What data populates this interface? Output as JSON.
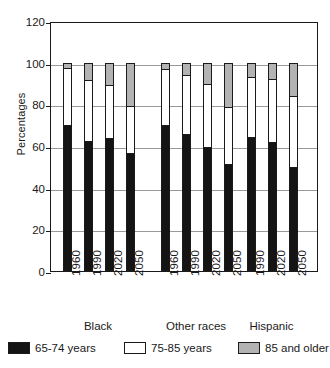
{
  "chart_data": {
    "type": "bar",
    "subtype": "stacked-bar-100",
    "title": "",
    "xlabel": "",
    "ylabel": "Percentages",
    "ylim": [
      0,
      120
    ],
    "yticks": [
      0,
      20,
      40,
      60,
      80,
      100,
      120
    ],
    "ytick_labels": [
      "0",
      "20",
      "40",
      "60",
      "80",
      "100",
      "120"
    ],
    "grid": true,
    "legend_position": "below",
    "legend": [
      "65-74 years",
      "75-85 years",
      "85 and older"
    ],
    "series": [
      {
        "name": "65-74 years",
        "color": "#141414",
        "values": [
          70,
          62,
          63.5,
          56,
          70,
          65.5,
          59,
          51,
          64,
          61.5,
          49.5
        ]
      },
      {
        "name": "75-85 years",
        "color": "#ffffff",
        "values": [
          27.5,
          29.5,
          25.5,
          23,
          27,
          28.5,
          30.5,
          27.5,
          29,
          30.5,
          34.5
        ]
      },
      {
        "name": "85 and older",
        "color": "#b3b3b3",
        "values": [
          2.5,
          8.5,
          11,
          21,
          3,
          6,
          10.5,
          21.5,
          7,
          8,
          16
        ]
      }
    ],
    "categories": [
      "1960",
      "1990",
      "2020",
      "2050",
      "1960",
      "1990",
      "2020",
      "2050",
      "1990",
      "2020",
      "2050"
    ],
    "groups": [
      {
        "label": "Black",
        "categories": [
          "1960",
          "1990",
          "2020",
          "2050"
        ]
      },
      {
        "label": "Other races",
        "categories": [
          "1960",
          "1990",
          "2020",
          "2050"
        ]
      },
      {
        "label": "Hispanic",
        "categories": [
          "1990",
          "2020",
          "2050"
        ]
      }
    ],
    "bars": [
      {
        "group": "Black",
        "year": "1960",
        "young": 70,
        "mid": 27.5,
        "old": 2.5
      },
      {
        "group": "Black",
        "year": "1990",
        "young": 62,
        "mid": 29.5,
        "old": 8.5
      },
      {
        "group": "Black",
        "year": "2020",
        "young": 63.5,
        "mid": 25.5,
        "old": 11
      },
      {
        "group": "Black",
        "year": "2050",
        "young": 56,
        "mid": 23,
        "old": 21
      },
      {
        "group": "Other races",
        "year": "1960",
        "young": 70,
        "mid": 27,
        "old": 3
      },
      {
        "group": "Other races",
        "year": "1990",
        "young": 65.5,
        "mid": 28.5,
        "old": 6
      },
      {
        "group": "Other races",
        "year": "2020",
        "young": 59,
        "mid": 30.5,
        "old": 10.5
      },
      {
        "group": "Other races",
        "year": "2050",
        "young": 51,
        "mid": 27.5,
        "old": 21.5
      },
      {
        "group": "Hispanic",
        "year": "1990",
        "young": 64,
        "mid": 29,
        "old": 7
      },
      {
        "group": "Hispanic",
        "year": "2020",
        "young": 61.5,
        "mid": 30.5,
        "old": 8
      },
      {
        "group": "Hispanic",
        "year": "2050",
        "young": 49.5,
        "mid": 34.5,
        "old": 16
      }
    ]
  }
}
